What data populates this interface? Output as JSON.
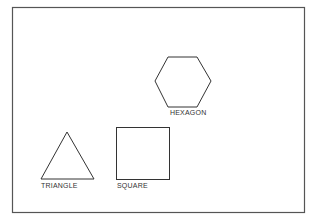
{
  "diagram": {
    "border_color": "#555555",
    "shapes": [
      {
        "name": "hexagon",
        "label": "HEXAGON"
      },
      {
        "name": "triangle",
        "label": "TRIANGLE"
      },
      {
        "name": "square",
        "label": "SQUARE"
      }
    ]
  }
}
